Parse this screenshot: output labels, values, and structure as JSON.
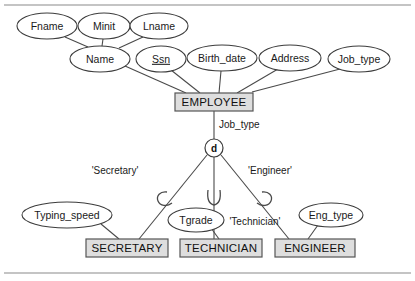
{
  "diagram": {
    "type": "eer-specialization",
    "colors": {
      "entity_fill": "#dedede",
      "entity_stroke": "#555555",
      "ellipse_fill": "#ffffff",
      "line": "#4a4a4a",
      "frame": "#8a8a8a",
      "text": "#1a1a1a"
    },
    "superclass": {
      "name": "EMPLOYEE",
      "box": {
        "x": 175,
        "y": 93,
        "w": 78,
        "h": 18
      },
      "attributes": [
        {
          "label": "Fname",
          "key": false,
          "cx": 47,
          "cy": 26,
          "rx": 30,
          "ry": 13
        },
        {
          "label": "Minit",
          "key": false,
          "cx": 104,
          "cy": 26,
          "rx": 26,
          "ry": 13
        },
        {
          "label": "Lname",
          "key": false,
          "cx": 159,
          "cy": 26,
          "rx": 29,
          "ry": 13
        },
        {
          "label": "Name",
          "key": false,
          "cx": 100,
          "cy": 59,
          "rx": 30,
          "ry": 13
        },
        {
          "label": "Ssn",
          "key": true,
          "cx": 161,
          "cy": 59,
          "rx": 25,
          "ry": 13
        },
        {
          "label": "Birth_date",
          "key": false,
          "cx": 222,
          "cy": 58,
          "rx": 35,
          "ry": 13
        },
        {
          "label": "Address",
          "key": false,
          "cx": 290,
          "cy": 58,
          "rx": 31,
          "ry": 13
        },
        {
          "label": "Job_type",
          "key": false,
          "cx": 359,
          "cy": 59,
          "rx": 31,
          "ry": 13
        }
      ]
    },
    "specialization": {
      "defining_attribute": "Job_type",
      "circle_symbol": "d",
      "circle_meaning": "disjoint",
      "circle": {
        "cx": 214,
        "cy": 148,
        "r": 9
      },
      "predicates": [
        {
          "label": "'Secretary'",
          "x": 115,
          "y": 171
        },
        {
          "label": "'Technician'",
          "x": 228,
          "y": 222
        },
        {
          "label": "'Engineer'",
          "x": 243,
          "y": 171
        }
      ]
    },
    "subclasses": [
      {
        "name": "SECRETARY",
        "box": {
          "x": 86,
          "y": 239,
          "w": 82,
          "h": 18
        },
        "attribute": {
          "label": "Typing_speed",
          "cx": 67,
          "cy": 215,
          "rx": 45,
          "ry": 13
        }
      },
      {
        "name": "TECHNICIAN",
        "box": {
          "x": 180,
          "y": 239,
          "w": 82,
          "h": 18
        },
        "attribute": {
          "label": "Tgrade",
          "cx": 196,
          "cy": 220,
          "rx": 28,
          "ry": 12
        }
      },
      {
        "name": "ENGINEER",
        "box": {
          "x": 275,
          "y": 239,
          "w": 80,
          "h": 18
        },
        "attribute": {
          "label": "Eng_type",
          "cx": 331,
          "cy": 215,
          "rx": 32,
          "ry": 12
        }
      }
    ]
  }
}
